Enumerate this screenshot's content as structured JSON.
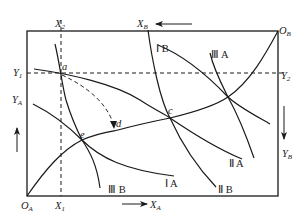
{
  "diagram": {
    "type": "Edgeworth box",
    "origins": {
      "A": {
        "label": "O",
        "sub": "A"
      },
      "B": {
        "label": "O",
        "sub": "B"
      }
    },
    "axes": {
      "XA": {
        "label": "X",
        "sub": "A",
        "arrow": "right"
      },
      "YA": {
        "label": "Y",
        "sub": "A",
        "arrow": "up"
      },
      "XB": {
        "label": "X",
        "sub": "B",
        "arrow": "left"
      },
      "YB": {
        "label": "Y",
        "sub": "B",
        "arrow": "down"
      }
    },
    "guide_lines": {
      "X1": {
        "label": "X",
        "sub": "1"
      },
      "X2": {
        "label": "X",
        "sub": "2"
      },
      "Y1": {
        "label": "Y",
        "sub": "1"
      },
      "Y2": {
        "label": "Y",
        "sub": "2"
      }
    },
    "points": {
      "a": "a",
      "c": "c",
      "d": "d",
      "e": "e"
    },
    "indifference_curves_A": [
      "Ⅰ A",
      "Ⅱ A",
      "Ⅲ A"
    ],
    "indifference_curves_B": [
      "Ⅰ B",
      "Ⅱ B",
      "Ⅲ B"
    ],
    "curve_labels": {
      "IA": "Ⅰ A",
      "IIA": "Ⅱ A",
      "IIIA": "Ⅲ A",
      "IB": "Ⅰ B",
      "IIB": "Ⅱ B",
      "IIIB": "Ⅲ B"
    },
    "stroke_color": "#1a1a1a",
    "background": "#ffffff"
  }
}
